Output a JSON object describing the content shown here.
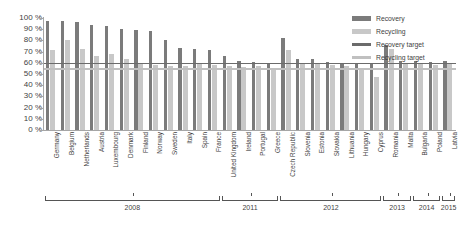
{
  "chart_data": {
    "type": "bar",
    "title": "",
    "subtitle": "",
    "xlabel": "",
    "ylabel": "",
    "ylim": [
      0,
      100
    ],
    "grid": false,
    "legend_position": "top-right",
    "y_ticks": [
      "0 %",
      "10 %",
      "20 %",
      "30 %",
      "40 %",
      "50 %",
      "60 %",
      "70 %",
      "80 %",
      "90 %",
      "100 %"
    ],
    "y_tick_values": [
      0,
      10,
      20,
      30,
      40,
      50,
      60,
      70,
      80,
      90,
      100
    ],
    "categories": [
      "Germany",
      "Belgium",
      "Netherlands",
      "Austria",
      "Luxembourg",
      "Denmark",
      "Finland",
      "Norway",
      "Sweden",
      "Italy",
      "Spain",
      "France",
      "United Kingdom",
      "Ireland",
      "Portugal",
      "Greece",
      "Czech Republic",
      "Slovenia",
      "Estonia",
      "Slovakia",
      "Lithuania",
      "Hungary",
      "Cyprus",
      "Romania",
      "Malta",
      "Bulgaria",
      "Poland",
      "Latvia"
    ],
    "series": [
      {
        "name": "Recovery",
        "color": "#7b7b7b",
        "values": [
          97,
          97,
          96,
          94,
          93,
          90,
          89,
          88,
          80,
          73,
          72,
          71,
          66,
          62,
          61,
          60,
          82,
          63,
          63,
          61,
          60,
          60,
          60,
          76,
          62,
          62,
          61,
          62
        ]
      },
      {
        "name": "Recycling",
        "color": "#c8c8c8",
        "values": [
          71,
          80,
          72,
          66,
          68,
          63,
          60,
          58,
          57,
          57,
          60,
          58,
          57,
          56,
          57,
          55,
          71,
          60,
          60,
          58,
          57,
          55,
          47,
          72,
          60,
          60,
          58,
          59
        ]
      }
    ],
    "reference_lines": [
      {
        "name": "Recovery target",
        "value": 60,
        "color": "#6b6b6b"
      },
      {
        "name": "Recycling target",
        "value": 55,
        "color": "#c0c0c0"
      }
    ],
    "year_groups": [
      {
        "label": "2008",
        "start_index": 0,
        "end_index": 11
      },
      {
        "label": "2011",
        "start_index": 12,
        "end_index": 15
      },
      {
        "label": "2012",
        "start_index": 16,
        "end_index": 22
      },
      {
        "label": "2013",
        "start_index": 23,
        "end_index": 24
      },
      {
        "label": "2014",
        "start_index": 25,
        "end_index": 26
      },
      {
        "label": "2015",
        "start_index": 27,
        "end_index": 27
      }
    ]
  }
}
